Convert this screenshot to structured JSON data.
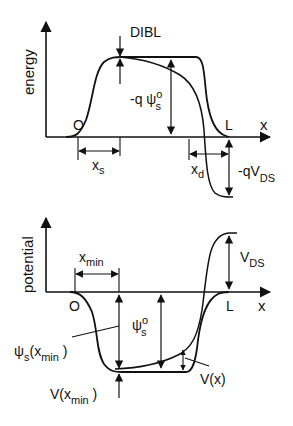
{
  "top_panel": {
    "y_axis_label": "energy",
    "x_axis_label": "x",
    "origin_label": "O",
    "end_label": "L",
    "dibl_label": "DIBL",
    "barrier_label_prefix": "-q ψ",
    "barrier_label_sup": "o",
    "barrier_label_sub": "s",
    "xs_label_main": "x",
    "xs_label_sub": "s",
    "xd_label_main": "x",
    "xd_label_sub": "d",
    "vds_label_main": "-qV",
    "vds_label_sub": "DS"
  },
  "bottom_panel": {
    "y_axis_label": "potential",
    "x_axis_label": "x",
    "origin_label": "O",
    "end_label": "L",
    "xmin_label_main": "x",
    "xmin_label_sub": "min",
    "vds_label_main": "V",
    "vds_label_sub": "DS",
    "psi_label_main": "ψ",
    "psi_label_sup": "o",
    "psi_label_sub": "s",
    "psi_xmin_label_main": "ψ",
    "psi_xmin_label_sub": "s",
    "psi_xmin_label_arg": "(x",
    "psi_xmin_label_arg_sub": "min",
    "psi_xmin_label_close": " )",
    "vx_label": "V(x)",
    "vxmin_label_main": "V(x",
    "vxmin_label_sub": "min",
    "vxmin_label_close": " )"
  },
  "colors": {
    "ink": "#111111",
    "background": "#ffffff"
  }
}
